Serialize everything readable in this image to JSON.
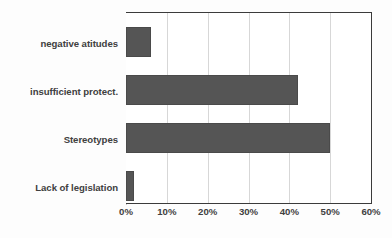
{
  "chart_data": {
    "type": "bar",
    "orientation": "horizontal",
    "title": "",
    "subtitle": "",
    "xlabel": "",
    "ylabel": "",
    "categories": [
      "negative atitudes",
      "insufficient protect.",
      "Stereotypes",
      "Lack of legislation"
    ],
    "values": [
      6,
      42,
      50,
      2
    ],
    "value_format": "percent",
    "xlim": [
      0,
      60
    ],
    "xticks": [
      0,
      10,
      20,
      30,
      40,
      50,
      60
    ],
    "xtick_labels": [
      "0%",
      "10%",
      "20%",
      "30%",
      "40%",
      "50%",
      "60%"
    ],
    "grid": "vertical",
    "legend": "none",
    "series": [
      {
        "name": "",
        "values": [
          6,
          42,
          50,
          2
        ],
        "color": "#555555"
      }
    ],
    "annotations": []
  },
  "colors": {
    "bar": "#555555",
    "bar_outline": "#4a4a4a",
    "gridline": "#d7d7d7",
    "axis": "#3b3b3b",
    "text": "#404040",
    "plot_background": "#ffffff",
    "figure_background": "#fdfdfd"
  }
}
